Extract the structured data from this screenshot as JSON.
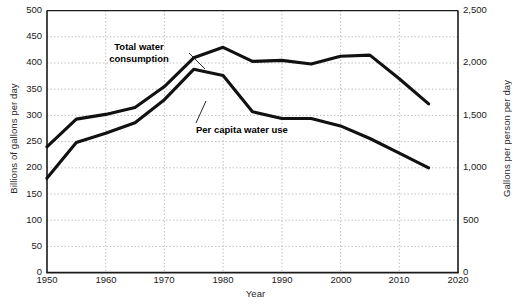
{
  "chart_data": {
    "type": "line",
    "title": "",
    "xlabel": "Year",
    "ylabel": "Billions of gallons per day",
    "ylabel_right": "Gallons per person per day",
    "xlim": [
      1950,
      2020
    ],
    "ylim": [
      0,
      500
    ],
    "ylim_right": [
      0,
      2500
    ],
    "grid": true,
    "legend_position": "inline-annotations",
    "xticks": [
      "1950",
      "1960",
      "1970",
      "1980",
      "1990",
      "2000",
      "2010",
      "2020"
    ],
    "xtick_values": [
      1950,
      1960,
      1970,
      1980,
      1990,
      2000,
      2010,
      2020
    ],
    "yticks_left": [
      "0",
      "50",
      "100",
      "150",
      "200",
      "250",
      "300",
      "350",
      "400",
      "450",
      "500"
    ],
    "ytick_values_left": [
      0,
      50,
      100,
      150,
      200,
      250,
      300,
      350,
      400,
      450,
      500
    ],
    "yticks_right": [
      "0",
      "500",
      "1,000",
      "1,500",
      "2,000",
      "2,500"
    ],
    "ytick_values_right": [
      0,
      500,
      1000,
      1500,
      2000,
      2500
    ],
    "series": [
      {
        "name": "Total water consumption",
        "axis": "left",
        "unit": "Billions of gallons per day",
        "color": "#111111",
        "x": [
          1950,
          1955,
          1960,
          1965,
          1970,
          1975,
          1980,
          1985,
          1990,
          1995,
          2000,
          2005,
          2010,
          2015
        ],
        "values": [
          240,
          293,
          302,
          315,
          355,
          410,
          430,
          403,
          405,
          398,
          413,
          415,
          370,
          322
        ]
      },
      {
        "name": "Per capita water use",
        "axis": "right",
        "unit": "Gallons per person per day",
        "color": "#111111",
        "x": [
          1950,
          1955,
          1960,
          1965,
          1970,
          1975,
          1980,
          1985,
          1990,
          1995,
          2000,
          2005,
          2010,
          2015
        ],
        "values": [
          900,
          1240,
          1330,
          1430,
          1650,
          1940,
          1880,
          1535,
          1470,
          1470,
          1400,
          1280,
          1140,
          1000
        ],
        "values_left_scale": [
          180,
          248,
          266,
          286,
          330,
          388,
          376,
          307,
          294,
          294,
          280,
          256,
          228,
          200
        ]
      }
    ],
    "annotations": [
      {
        "name": "total-water-consumption-label",
        "text_line1": "Total water",
        "text_line2": "consumption",
        "points_to_x": 1973,
        "points_to_y": 380
      },
      {
        "name": "per-capita-water-use-label",
        "text": "Per capita water use",
        "points_to_x": 1983,
        "points_to_y": 330
      }
    ]
  }
}
